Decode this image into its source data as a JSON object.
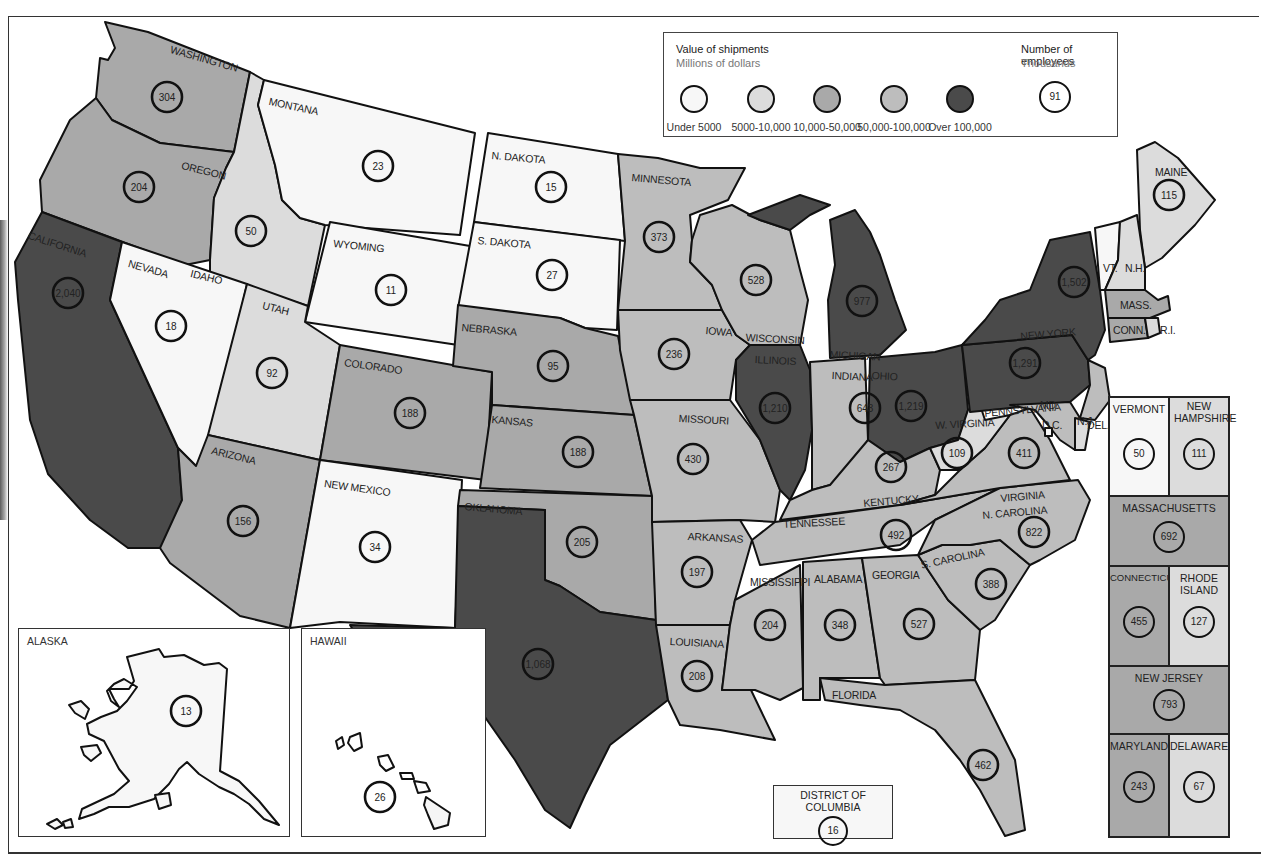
{
  "legend": {
    "value_title": "Value of shipments",
    "value_subtitle": "Millions of dollars",
    "employees_title": "Number of employees",
    "employees_subtitle": "Thousands",
    "employees_example": "91",
    "categories": [
      {
        "key": "c1",
        "label": "Under 5000",
        "color": "#f7f7f7"
      },
      {
        "key": "c2",
        "label": "5000-10,000",
        "color": "#dcdcdc"
      },
      {
        "key": "c3",
        "label": "10,000-50,000",
        "color": "#a9a9a9"
      },
      {
        "key": "c4",
        "label": "50,000-100,000",
        "color": "#bdbdbd"
      },
      {
        "key": "c5",
        "label": "Over 100,000",
        "color": "#4a4a4a"
      }
    ]
  },
  "states": [
    {
      "id": "washington",
      "label": "WASHINGTON",
      "employees": "304",
      "category": "c3"
    },
    {
      "id": "oregon",
      "label": "OREGON",
      "employees": "204",
      "category": "c3"
    },
    {
      "id": "california",
      "label": "CALIFORNIA",
      "employees": "2,040",
      "category": "c5"
    },
    {
      "id": "idaho",
      "label": "IDAHO",
      "employees": "50",
      "category": "c2"
    },
    {
      "id": "nevada",
      "label": "NEVADA",
      "employees": "18",
      "category": "c1"
    },
    {
      "id": "montana",
      "label": "MONTANA",
      "employees": "23",
      "category": "c1"
    },
    {
      "id": "wyoming",
      "label": "WYOMING",
      "employees": "11",
      "category": "c1"
    },
    {
      "id": "utah",
      "label": "UTAH",
      "employees": "92",
      "category": "c2"
    },
    {
      "id": "colorado",
      "label": "COLORADO",
      "employees": "188",
      "category": "c3"
    },
    {
      "id": "arizona",
      "label": "ARIZONA",
      "employees": "156",
      "category": "c3"
    },
    {
      "id": "new-mexico",
      "label": "NEW MEXICO",
      "employees": "34",
      "category": "c1"
    },
    {
      "id": "north-dakota",
      "label": "N. DAKOTA",
      "employees": "15",
      "category": "c1"
    },
    {
      "id": "south-dakota",
      "label": "S. DAKOTA",
      "employees": "27",
      "category": "c1"
    },
    {
      "id": "nebraska",
      "label": "NEBRASKA",
      "employees": "95",
      "category": "c3"
    },
    {
      "id": "kansas",
      "label": "KANSAS",
      "employees": "188",
      "category": "c3"
    },
    {
      "id": "oklahoma",
      "label": "OKLAHOMA",
      "employees": "205",
      "category": "c3"
    },
    {
      "id": "texas",
      "label": "TEXAS",
      "employees": "1,068",
      "category": "c5"
    },
    {
      "id": "minnesota",
      "label": "MINNESOTA",
      "employees": "373",
      "category": "c4"
    },
    {
      "id": "iowa",
      "label": "IOWA",
      "employees": "236",
      "category": "c4"
    },
    {
      "id": "missouri",
      "label": "MISSOURI",
      "employees": "430",
      "category": "c4"
    },
    {
      "id": "arkansas",
      "label": "ARKANSAS",
      "employees": "197",
      "category": "c4"
    },
    {
      "id": "louisiana",
      "label": "LOUISIANA",
      "employees": "208",
      "category": "c4"
    },
    {
      "id": "wisconsin",
      "label": "WISCONSIN",
      "employees": "528",
      "category": "c4"
    },
    {
      "id": "illinois",
      "label": "ILLINOIS",
      "employees": "1,210",
      "category": "c5"
    },
    {
      "id": "michigan",
      "label": "MICHIGAN",
      "employees": "977",
      "category": "c5"
    },
    {
      "id": "indiana",
      "label": "INDIANA",
      "employees": "643",
      "category": "c4"
    },
    {
      "id": "ohio",
      "label": "OHIO",
      "employees": "1,219",
      "category": "c5"
    },
    {
      "id": "kentucky",
      "label": "KENTUCKY",
      "employees": "267",
      "category": "c4"
    },
    {
      "id": "tennessee",
      "label": "TENNESSEE",
      "employees": "492",
      "category": "c4"
    },
    {
      "id": "mississippi",
      "label": "MISSISSIPPI",
      "employees": "204",
      "category": "c4"
    },
    {
      "id": "alabama",
      "label": "ALABAMA",
      "employees": "348",
      "category": "c4"
    },
    {
      "id": "georgia",
      "label": "GEORGIA",
      "employees": "527",
      "category": "c4"
    },
    {
      "id": "florida",
      "label": "FLORIDA",
      "employees": "462",
      "category": "c4"
    },
    {
      "id": "south-carolina",
      "label": "S. CAROLINA",
      "employees": "388",
      "category": "c4"
    },
    {
      "id": "north-carolina",
      "label": "N. CAROLINA",
      "employees": "822",
      "category": "c4"
    },
    {
      "id": "virginia",
      "label": "VIRGINIA",
      "employees": "411",
      "category": "c4"
    },
    {
      "id": "west-virginia",
      "label": "W. VIRGINIA",
      "employees": "109",
      "category": "c2"
    },
    {
      "id": "pennsylvania",
      "label": "PENNSYLVANIA",
      "employees": "1,291",
      "category": "c5"
    },
    {
      "id": "new-york",
      "label": "NEW YORK",
      "employees": "1,502",
      "category": "c5"
    },
    {
      "id": "maine",
      "label": "MAINE",
      "employees": "115",
      "category": "c2"
    },
    {
      "id": "vermont-map",
      "label": "VT.",
      "employees": "",
      "category": "c1"
    },
    {
      "id": "new-hampshire-map",
      "label": "N.H.",
      "employees": "",
      "category": "c2"
    },
    {
      "id": "massachusetts-map",
      "label": "MASS.",
      "employees": "",
      "category": "c3"
    },
    {
      "id": "connecticut-map",
      "label": "CONN.",
      "employees": "",
      "category": "c3"
    },
    {
      "id": "rhode-island-map",
      "label": "R.I.",
      "employees": "",
      "category": "c2"
    },
    {
      "id": "new-jersey-map",
      "label": "N.J.",
      "employees": "",
      "category": "c4"
    },
    {
      "id": "maryland-map",
      "label": "MD.",
      "employees": "",
      "category": "c4"
    },
    {
      "id": "delaware-map",
      "label": "DEL.",
      "employees": "",
      "category": "c2"
    },
    {
      "id": "dc-map",
      "label": "D.C.",
      "employees": "",
      "category": "c1"
    }
  ],
  "insets": {
    "alaska": {
      "label": "ALASKA",
      "employees": "13",
      "category": "c1"
    },
    "hawaii": {
      "label": "HAWAII",
      "employees": "26",
      "category": "c1"
    },
    "dc": {
      "label": "DISTRICT OF COLUMBIA",
      "employees": "16",
      "category": "c1"
    }
  },
  "northeast_panel": [
    {
      "id": "vermont",
      "label": "VERMONT",
      "employees": "50",
      "category": "c1"
    },
    {
      "id": "new-hampshire",
      "label": "NEW HAMPSHIRE",
      "employees": "111",
      "category": "c2"
    },
    {
      "id": "massachusetts",
      "label": "MASSACHUSETTS",
      "employees": "692",
      "category": "c3"
    },
    {
      "id": "connecticut",
      "label": "CONNECTICUT",
      "employees": "455",
      "category": "c3"
    },
    {
      "id": "rhode-island",
      "label": "RHODE ISLAND",
      "employees": "127",
      "category": "c2"
    },
    {
      "id": "new-jersey",
      "label": "NEW JERSEY",
      "employees": "793",
      "category": "c3"
    },
    {
      "id": "maryland",
      "label": "MARYLAND",
      "employees": "243",
      "category": "c3"
    },
    {
      "id": "delaware",
      "label": "DELAWARE",
      "employees": "67",
      "category": "c2"
    }
  ]
}
